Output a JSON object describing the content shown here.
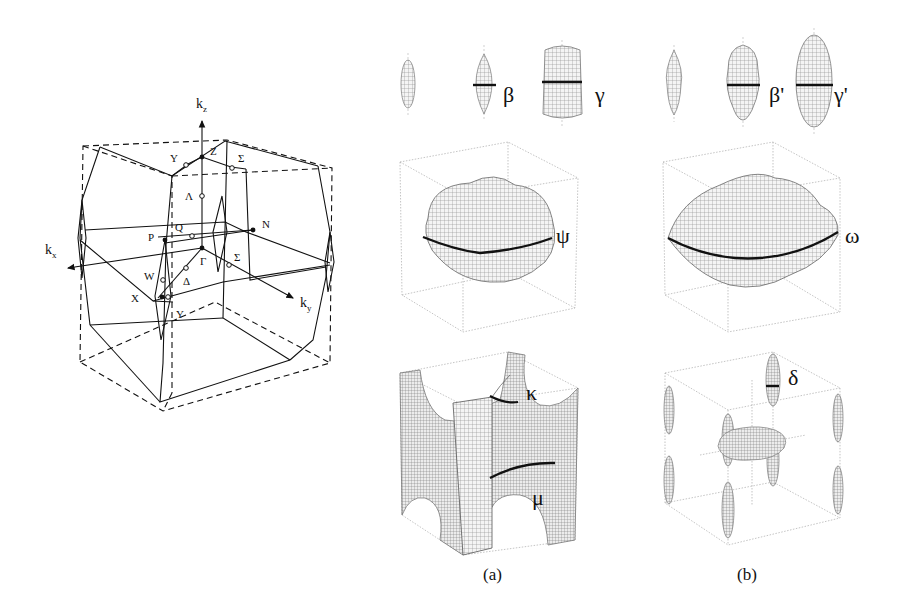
{
  "figure": {
    "left_panel": {
      "title": "Brillouin zone (body-centered tetragonal)",
      "axes": {
        "kx": "k",
        "kx_sub": "x",
        "ky": "k",
        "ky_sub": "y",
        "kz": "k",
        "kz_sub": "z"
      },
      "points": {
        "Gamma": "Γ",
        "Z": "Z",
        "X": "X",
        "N": "N",
        "P": "P",
        "Lambda": "Λ",
        "Sigma_top": "Σ",
        "Sigma_mid": "Σ",
        "Delta": "Δ",
        "Q": "Q",
        "W": "W",
        "Y_top": "Y",
        "Y_bottom": "Y"
      }
    },
    "panel_a": {
      "caption": "(a)",
      "top_row": {
        "beta": "β",
        "gamma": "γ"
      },
      "middle": {
        "psi": "ψ"
      },
      "bottom": {
        "kappa": "κ",
        "mu": "μ"
      }
    },
    "panel_b": {
      "caption": "(b)",
      "top_row": {
        "beta_prime": "β'",
        "gamma_prime": "γ'"
      },
      "middle": {
        "omega": "ω"
      },
      "bottom": {
        "delta": "δ"
      }
    },
    "colors": {
      "line": "#111111",
      "mesh": "#9a9a9a",
      "box": "#b0b0b0",
      "background": "#ffffff"
    }
  }
}
